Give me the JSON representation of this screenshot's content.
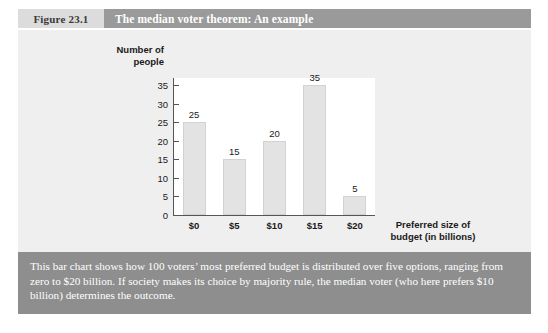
{
  "header": {
    "figure_label": "Figure 23.1",
    "title": "The median voter theorem: An example"
  },
  "caption": {
    "text": "This bar chart shows how 100 voters’ most preferred budget is distributed over five options, ranging from zero to $20 billion. If society makes its choice by majority rule, the median voter (who here prefers $10 billion) determines the outcome."
  },
  "colors": {
    "figure_label_bg": "#dcdcdc",
    "title_bg": "#9a9a9a",
    "panel_bg": "#efefef",
    "plot_bg": "#ffffff",
    "bar_fill": "#e3e3e3",
    "caption_bg": "#8e8e8e",
    "text_dark": "#1a1a1a",
    "axis": "#555555"
  },
  "chart_data": {
    "type": "bar",
    "title": "The median voter theorem: An example",
    "categories": [
      "$0",
      "$5",
      "$10",
      "$15",
      "$20"
    ],
    "values": [
      25,
      15,
      20,
      35,
      5
    ],
    "xlabel": "Preferred size of budget (in billions)",
    "xlabel_lines": [
      "Preferred size of",
      "budget (in billions)"
    ],
    "ylabel": "Number of people",
    "ylabel_lines": [
      "Number of",
      "people"
    ],
    "ylim": [
      0,
      37
    ],
    "yticks": [
      0,
      5,
      10,
      15,
      20,
      25,
      30,
      35
    ],
    "grid": false,
    "legend": false,
    "data_labels": true
  }
}
